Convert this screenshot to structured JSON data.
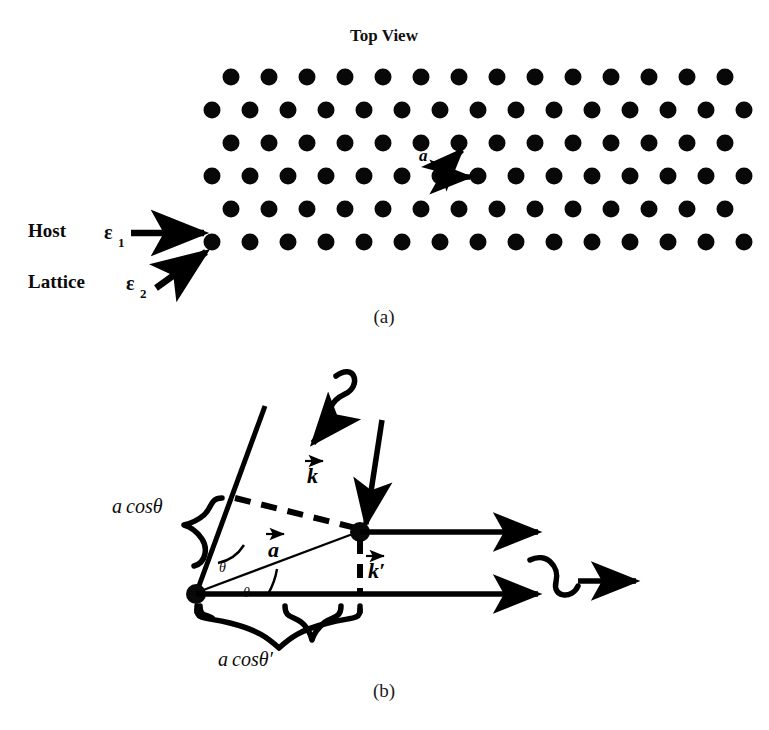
{
  "figure": {
    "panel_a": {
      "title": "Top View",
      "caption": "(a)",
      "labels": {
        "host": "Host",
        "host_symbol": "ε",
        "host_subscript": "1",
        "lattice": "Lattice",
        "lattice_symbol": "ε",
        "lattice_subscript": "2",
        "lattice_vector": "a"
      },
      "icons": {
        "host_arrow": "arrow-right-icon",
        "lattice_arrow": "arrow-diagonal-up-right-icon",
        "basis_vector_arrow_1": "arrow-diagonal-up-right-icon",
        "basis_vector_arrow_2": "arrow-right-icon"
      },
      "lattice": {
        "type": "triangular",
        "rows": 6,
        "dots_per_row": [
          14,
          15,
          14,
          15,
          14,
          15
        ],
        "dot_radius_px": 8.5,
        "x_spacing_px": 38,
        "y_spacing_px": 33,
        "row_offset_px": 19,
        "origin_x_px": 212,
        "origin_y_px": 77,
        "dot_color": "#080808"
      }
    },
    "panel_b": {
      "caption": "(b)",
      "labels": {
        "a_cos_theta": "a cosθ",
        "a_cos_theta_prime": "a cosθ′",
        "k_vector": "k",
        "k_prime_vector": "k′",
        "a_vector": "a",
        "theta_upper": "θ",
        "theta_lower": "θ"
      },
      "icons": {
        "incident_wave": "sine-wave-arrow-icon",
        "scattered_wave": "sine-wave-arrow-icon",
        "incident_ray_1": "arrow-down-left-icon",
        "incident_ray_2": "arrow-down-left-icon",
        "outgoing_ray_1": "arrow-right-icon",
        "outgoing_ray_2": "arrow-right-icon",
        "brace_upper": "curly-brace-icon",
        "brace_lower": "curly-brace-icon",
        "scatterer_upper": "lattice-point-dot-icon",
        "scatterer_lower": "lattice-point-dot-icon",
        "path_difference_dashed": "dashed-segment-icon"
      },
      "geometry": {
        "scatterer_upper_px": [
          360,
          532
        ],
        "scatterer_lower_px": [
          196,
          594
        ],
        "theta_degrees": 21,
        "wavefront_angle_degrees": 62
      }
    }
  },
  "colors": {
    "ink": "#000000",
    "background": "#ffffff"
  }
}
